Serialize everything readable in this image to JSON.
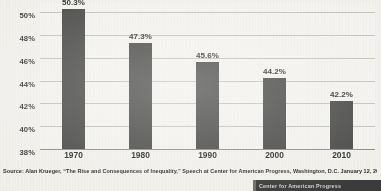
{
  "chart_data": {
    "type": "bar",
    "title": "",
    "subtitle": "",
    "xlabel": "",
    "ylabel": "",
    "categories": [
      "1970",
      "1980",
      "1990",
      "2000",
      "2010"
    ],
    "values": [
      50.3,
      47.3,
      45.6,
      44.2,
      42.2
    ],
    "value_labels": [
      "50.3%",
      "47.3%",
      "45.6%",
      "44.2%",
      "42.2%"
    ],
    "ylim": [
      38,
      50.8
    ],
    "y_ticks": [
      38,
      40,
      42,
      44,
      46,
      48,
      50
    ],
    "y_tick_labels": [
      "38%",
      "40%",
      "42%",
      "44%",
      "46%",
      "48%",
      "50%"
    ],
    "grid": true,
    "legend": false,
    "legend_position": "none",
    "series": [
      {
        "name": "",
        "values": [
          50.3,
          47.3,
          45.6,
          44.2,
          42.2
        ],
        "color": "#4a4a48"
      }
    ]
  },
  "footer": {
    "source": "Source: Alan Krueger, “The Rise and Consequences of Inequality,” Speech at Center for American Progress, Washington, D.C. January 12, 2012",
    "logo_text": "Center for American Progress"
  },
  "colors": {
    "bar": "#4a4a48",
    "gridline": "#bcbcb8",
    "axis": "#8f8f8a",
    "paper": "#f3f2ed",
    "text": "#2e2e2c",
    "logo_bg": "#3b3b3b",
    "logo_fg": "#d6d6d2"
  }
}
